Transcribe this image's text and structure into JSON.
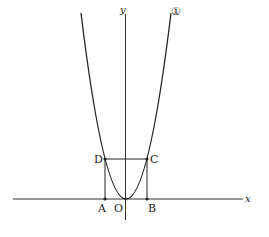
{
  "figure": {
    "axes": {
      "x_label": "x",
      "y_label": "y",
      "origin_label": "O"
    },
    "curve": {
      "label": "①",
      "description": "parabola through origin, opening upward"
    },
    "points": {
      "A": "A",
      "B": "B",
      "C": "C",
      "D": "D"
    },
    "colors": {
      "line": "#222222",
      "background": "#ffffff"
    }
  }
}
